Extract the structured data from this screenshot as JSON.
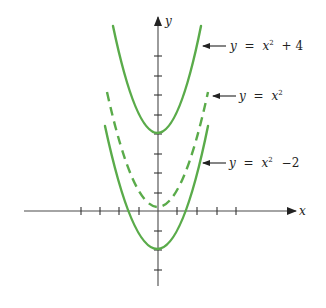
{
  "figure": {
    "type": "graph-of-vertical-shifts",
    "colors": {
      "curve": "#5aab4a",
      "axis": "#4a4a4a",
      "text": "#222222"
    },
    "axes": {
      "x_label": "x",
      "y_label": "y",
      "x_ticks": [
        -4,
        -3,
        -2,
        -1,
        1,
        2,
        3,
        4
      ],
      "y_ticks": [
        -3,
        -2,
        -1,
        1,
        2,
        3,
        4,
        5,
        6,
        7,
        8
      ]
    },
    "curves": [
      {
        "name": "y = x² + 4",
        "label_parts": {
          "y": "y",
          "eq": "=",
          "x": "x",
          "sup": "2",
          "rest": "+ 4"
        },
        "style": "solid",
        "vertex": [
          0,
          4
        ]
      },
      {
        "name": "y = x²",
        "label_parts": {
          "y": "y",
          "eq": "=",
          "x": "x",
          "sup": "2",
          "rest": ""
        },
        "style": "dashed",
        "vertex": [
          0,
          0
        ]
      },
      {
        "name": "y = x² − 2",
        "label_parts": {
          "y": "y",
          "eq": "=",
          "x": "x",
          "sup": "2",
          "rest": "−2"
        },
        "style": "solid",
        "vertex": [
          0,
          -2
        ]
      }
    ]
  }
}
